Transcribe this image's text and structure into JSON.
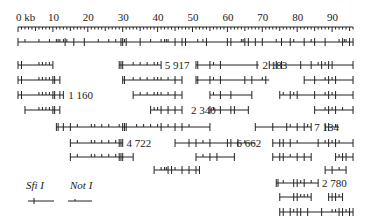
{
  "ruler": {
    "unit_label": "0  kb",
    "ticks": [
      "10",
      "20",
      "30",
      "40",
      "50",
      "60",
      "70",
      "80",
      "90"
    ],
    "max_kb": 96
  },
  "rows": [
    {
      "y": 42,
      "segments": [
        [
          0,
          96
        ]
      ],
      "label": null,
      "sites": [
        0,
        2,
        6,
        9,
        11,
        11.5,
        12,
        13,
        13.5,
        14,
        16,
        19,
        23,
        26,
        28,
        29.5,
        30,
        30.5,
        31,
        35,
        38,
        41,
        42,
        42.5,
        43,
        45,
        47,
        48,
        51.5,
        53,
        54,
        60,
        61,
        64,
        64.5,
        65,
        66,
        68,
        70,
        74,
        75.5,
        78,
        79,
        82,
        84,
        85,
        88,
        92,
        93,
        93.5,
        94,
        95,
        96
      ],
      "long": [
        0,
        13.5,
        16,
        19,
        29.5,
        30,
        31,
        35,
        45,
        47,
        48,
        54,
        60,
        61,
        65,
        66,
        68,
        70,
        75.5,
        78,
        82,
        85,
        88,
        93,
        95,
        96
      ]
    },
    {
      "y": 65,
      "segments": [
        [
          0,
          10
        ],
        [
          29,
          41
        ],
        [
          51,
          69
        ],
        [
          72,
          96
        ]
      ],
      "label": {
        "text": "5 917",
        "kb": 41.5
      },
      "label2": {
        "text": "2 183",
        "kb": 69.5
      },
      "sites": [
        0,
        1,
        6,
        7,
        8,
        9,
        10,
        29,
        29.5,
        30,
        33,
        35,
        37,
        39,
        40,
        41,
        51,
        51.5,
        55,
        56,
        58,
        68.5,
        72,
        74,
        75.5,
        81,
        84,
        86,
        87,
        88,
        89,
        90,
        96
      ],
      "long": [
        0,
        1,
        10,
        29,
        29.5,
        30,
        41,
        51,
        51.5,
        55,
        58,
        68.5,
        72,
        74,
        75.5,
        81,
        84,
        87,
        89,
        90,
        96
      ]
    },
    {
      "y": 80,
      "segments": [
        [
          0,
          12
        ],
        [
          30,
          47
        ],
        [
          51,
          72
        ],
        [
          82,
          96
        ]
      ],
      "sites": [
        0,
        1,
        6,
        7,
        8,
        9,
        10,
        10.5,
        12,
        30,
        30.5,
        33,
        35,
        37,
        39,
        40,
        41,
        43,
        45,
        47,
        51,
        51.5,
        55,
        56,
        58,
        65,
        67,
        70,
        71,
        82,
        85,
        88,
        89,
        90,
        91,
        96
      ],
      "long": [
        0,
        1,
        10,
        10.5,
        12,
        30,
        30.5,
        45,
        47,
        51,
        51.5,
        55,
        58,
        65,
        67,
        71,
        82,
        85,
        89,
        91,
        96
      ]
    },
    {
      "y": 95,
      "segments": [
        [
          0,
          13
        ],
        [
          33,
          47
        ],
        [
          55,
          67
        ],
        [
          75,
          96
        ]
      ],
      "label": {
        "text": "1 160",
        "kb": 13.8
      },
      "label3": null,
      "sites": [
        0,
        1,
        6,
        7,
        8,
        9,
        10,
        10.5,
        12,
        13,
        33,
        35,
        37,
        39,
        40,
        41,
        43,
        45,
        47,
        55,
        56,
        58,
        61,
        67,
        75,
        76,
        78,
        79,
        80,
        85,
        88,
        89,
        90,
        91,
        96
      ],
      "long": [
        0,
        1,
        10,
        10.5,
        12,
        13,
        33,
        45,
        47,
        55,
        58,
        61,
        67,
        75,
        78,
        80,
        85,
        89,
        91,
        96
      ]
    },
    {
      "y": 110,
      "segments": [
        [
          2,
          12
        ],
        [
          38,
          47
        ],
        [
          55,
          66
        ],
        [
          85,
          96
        ]
      ],
      "label": {
        "text": "2 340",
        "kb": 49
      },
      "sites": [
        2,
        6,
        7,
        8,
        9,
        10,
        10.5,
        12,
        38,
        39,
        40,
        41,
        43,
        45,
        47,
        55,
        56,
        58,
        61,
        62,
        66,
        85,
        88,
        89,
        90,
        91,
        93,
        96
      ],
      "long": [
        2,
        10,
        10.5,
        12,
        38,
        41,
        43,
        45,
        47,
        55,
        58,
        61,
        62,
        66,
        85,
        89,
        91,
        96
      ]
    },
    {
      "y": 127,
      "segments": [
        [
          11,
          55
        ],
        [
          68,
          84
        ],
        [
          88,
          92
        ]
      ],
      "label": {
        "text": "7 134",
        "kb": 84.3
      },
      "sites": [
        11,
        11.5,
        13,
        15,
        17,
        21,
        22,
        24,
        26,
        29,
        30,
        30.5,
        31,
        34,
        36,
        38,
        40,
        41,
        43,
        45,
        47,
        49,
        55,
        68,
        73,
        77,
        78,
        80,
        82,
        83,
        84,
        88,
        89,
        91
      ],
      "long": [
        11,
        11.5,
        13,
        15,
        30,
        30.5,
        31,
        41,
        45,
        47,
        55,
        68,
        73,
        77,
        80,
        82,
        84,
        88,
        89
      ]
    },
    {
      "y": 143,
      "segments": [
        [
          15,
          30
        ],
        [
          45,
          68
        ],
        [
          73,
          96
        ]
      ],
      "label": {
        "text": "4 722",
        "kb": 30.5
      },
      "label2": {
        "text": "6 662",
        "kb": 62
      },
      "sites": [
        15,
        17,
        21,
        22,
        24,
        26,
        28,
        29,
        29.5,
        30,
        45,
        49,
        51,
        53,
        55,
        60,
        61,
        63,
        65,
        73,
        75,
        76,
        78,
        80,
        86,
        88,
        89,
        90,
        91,
        92,
        96
      ],
      "long": [
        15,
        29,
        29.5,
        30,
        45,
        49,
        51,
        55,
        60,
        61,
        63,
        73,
        75,
        76,
        78,
        86,
        89,
        91,
        96
      ]
    },
    {
      "y": 157,
      "segments": [
        [
          15,
          33
        ],
        [
          51,
          62
        ],
        [
          73,
          84
        ],
        [
          91,
          96
        ]
      ],
      "sites": [
        15,
        17,
        21,
        22,
        24,
        26,
        28,
        29,
        29.5,
        30,
        33,
        51,
        53,
        55,
        57,
        62,
        73,
        75,
        76,
        78,
        80,
        82,
        84,
        91,
        92,
        93,
        94,
        96
      ],
      "long": [
        15,
        29,
        29.5,
        30,
        33,
        51,
        55,
        57,
        62,
        73,
        75,
        76,
        80,
        82,
        84,
        91,
        93,
        94,
        96
      ]
    },
    {
      "y": 170,
      "segments": [
        [
          39,
          52
        ],
        [
          88,
          94
        ]
      ],
      "sites": [
        39,
        41,
        42,
        42.5,
        43,
        44,
        45,
        47,
        49,
        51,
        52,
        88,
        90,
        92,
        94
      ],
      "long": [
        39,
        43,
        44,
        47,
        49,
        51,
        52,
        88,
        90,
        94
      ]
    },
    {
      "y": 183,
      "segments": [
        [
          74,
          86
        ]
      ],
      "label": {
        "text": "2 780",
        "kb": 86.5
      },
      "sites": [
        74,
        74.5,
        76,
        79,
        80,
        81,
        82,
        84,
        86
      ],
      "long": [
        74,
        74.5,
        79,
        80,
        82,
        86
      ]
    },
    {
      "y": 197,
      "segments": [
        [
          75,
          84
        ],
        [
          89,
          93
        ]
      ],
      "sites": [
        75,
        79,
        80,
        81,
        82,
        83,
        84,
        89,
        90,
        91,
        92,
        93
      ],
      "long": [
        75,
        79,
        80,
        84,
        89,
        90,
        91,
        93
      ]
    },
    {
      "y": 212,
      "segments": [
        [
          75,
          96
        ]
      ],
      "sites": [
        75,
        76,
        78,
        79,
        80,
        81,
        83,
        87,
        90,
        91,
        92,
        93,
        94,
        95,
        96
      ],
      "long": [
        75,
        76,
        78,
        80,
        81,
        83,
        87,
        92,
        93,
        95,
        96
      ]
    }
  ],
  "legend": {
    "sfi_label": "Sfi I",
    "not_label": "Not I"
  }
}
